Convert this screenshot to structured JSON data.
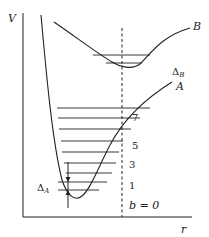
{
  "diagram": {
    "axis_labels": {
      "y": "V",
      "x": "r"
    },
    "curves": [
      {
        "id": "A",
        "label": "A"
      },
      {
        "id": "B",
        "label": "B"
      }
    ],
    "spacing_labels": {
      "A": {
        "symbol": "Δ",
        "subscript": "A"
      },
      "B": {
        "symbol": "Δ",
        "subscript": "B"
      }
    },
    "level_labels": [
      "1",
      "3",
      "5",
      "7"
    ],
    "ground_level_label": "b = 0",
    "curve_A_level_count": 9,
    "curve_B_level_count": 2
  }
}
